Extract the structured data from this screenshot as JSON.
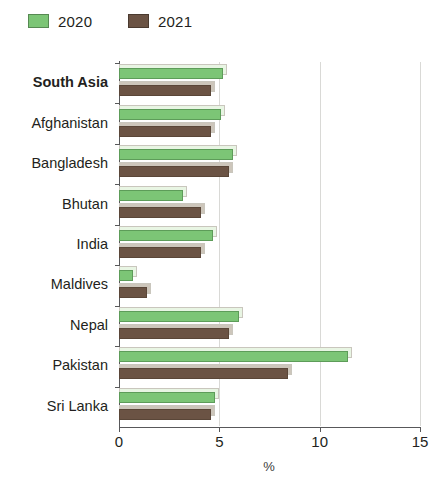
{
  "legend": {
    "position": "top-left",
    "entries": [
      {
        "label": "2020",
        "color": "#7cc576"
      },
      {
        "label": "2021",
        "color": "#6b5344"
      }
    ]
  },
  "axis": {
    "x_title": "%",
    "x_ticks": [
      "0",
      "5",
      "10",
      "15"
    ]
  },
  "chart_data": {
    "type": "bar",
    "orientation": "horizontal",
    "title": "",
    "subtitle": "",
    "xlabel": "%",
    "ylabel": "",
    "xlim": [
      0,
      15
    ],
    "xticks": [
      0,
      5,
      10,
      15
    ],
    "grid": "vertical",
    "legend_position": "top-left",
    "categories": [
      "South Asia",
      "Afghanistan",
      "Bangladesh",
      "Bhutan",
      "India",
      "Maldives",
      "Nepal",
      "Pakistan",
      "Sri Lanka"
    ],
    "emphasized_categories": [
      "South Asia"
    ],
    "series": [
      {
        "name": "2020",
        "color": "#7cc576",
        "values": [
          5.2,
          5.1,
          5.7,
          3.2,
          4.7,
          0.7,
          6.0,
          11.4,
          4.8
        ]
      },
      {
        "name": "2021",
        "color": "#6b5344",
        "values": [
          4.6,
          4.6,
          5.5,
          4.1,
          4.1,
          1.4,
          5.5,
          8.4,
          4.6
        ]
      }
    ]
  }
}
